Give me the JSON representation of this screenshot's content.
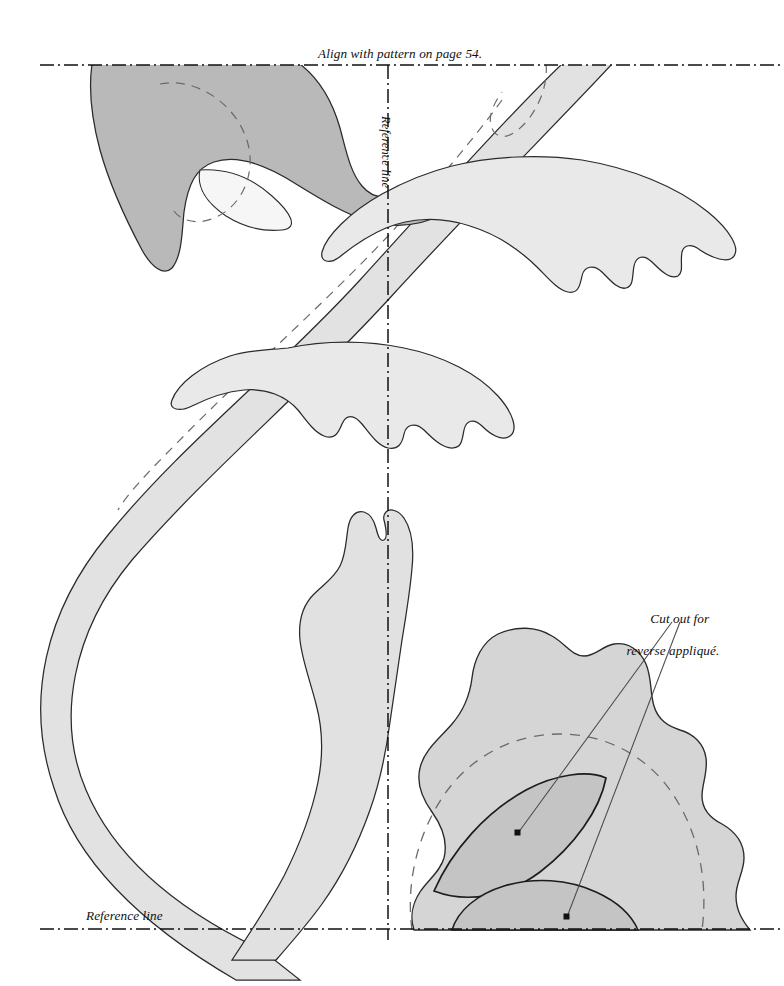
{
  "document": {
    "kind": "applique-pattern-template",
    "page_width": 784,
    "page_height": 986,
    "background_color": "#ffffff"
  },
  "labels": {
    "align_note": "Align with pattern on page 54.",
    "reference_line_vertical": "Reference line",
    "reference_line_bottom": "Reference line",
    "cutout_note_line1": "Cut out for",
    "cutout_note_line2": "reverse appliqué."
  },
  "colors": {
    "ink": "#111111",
    "outline": "#1c1c1c",
    "stem_fill": "#e2e2e2",
    "leaf_light_fill": "#e9e9e9",
    "leaf_dark_fill": "#b9b9b9",
    "leaf_highlight_fill": "#f5f5f5",
    "petal_fill": "#d5d5d5",
    "petal_inner_fill": "#c4c4c4",
    "dashed_seam": "#5a5a5a",
    "reference_line": "#111111",
    "leader_line": "#4a4a4a"
  },
  "guides": {
    "horizontal_top": {
      "y": 65,
      "x_start": 40,
      "x_end": 784,
      "style": "dash-dot"
    },
    "horizontal_bottom": {
      "y": 929,
      "x_start": 40,
      "x_end": 784,
      "style": "dash-dot"
    },
    "vertical_center": {
      "x": 388,
      "y_start": 65,
      "y_end": 940,
      "style": "dash-dot"
    }
  },
  "leaders": [
    {
      "name": "leader-to-lens-cutout",
      "from_x": 672,
      "from_y": 620,
      "to_x": 518,
      "to_y": 833
    },
    {
      "name": "leader-to-lower-cutout",
      "from_x": 678,
      "from_y": 620,
      "to_x": 567,
      "to_y": 917
    }
  ],
  "markers": [
    {
      "name": "cutout-dot-lens",
      "x": 518,
      "y": 833
    },
    {
      "name": "cutout-dot-lower",
      "x": 567,
      "y": 917
    }
  ],
  "shapes": [
    {
      "name": "stem-band",
      "fill": "#e2e2e2",
      "note": "long curving stem band crossing page"
    },
    {
      "name": "leaf-top-left",
      "fill": "#b9b9b9",
      "note": "dark leaf at upper left clipped by top reference line"
    },
    {
      "name": "leaf-top-left-highlight",
      "fill": "#f5f5f5",
      "note": "light overlapping petal section"
    },
    {
      "name": "leaf-upper-right",
      "fill": "#e9e9e9",
      "note": "scalloped leaf upper right"
    },
    {
      "name": "leaf-middle",
      "fill": "#e9e9e9",
      "note": "scalloped leaf center"
    },
    {
      "name": "leaf-long-vertical",
      "fill": "#e1e1e1",
      "note": "tall wavy leaf descending to bottom"
    },
    {
      "name": "flower-petal",
      "fill": "#d5d5d5",
      "note": "large scalloped flower at lower right"
    },
    {
      "name": "flower-lens-cutout",
      "fill": "#c4c4c4",
      "note": "pointed oval reverse-applique cutout"
    },
    {
      "name": "flower-lower-arc",
      "fill": "#c4c4c4",
      "note": "arched band reverse-applique cutout"
    }
  ]
}
